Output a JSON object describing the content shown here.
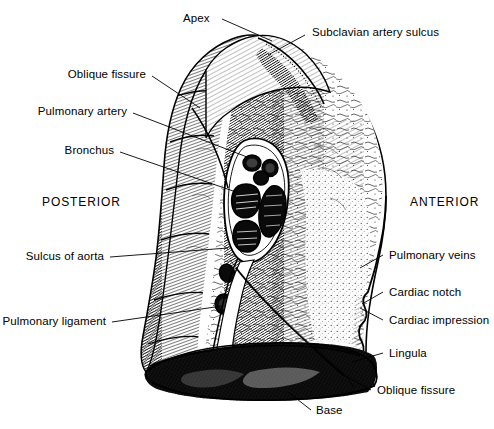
{
  "figure": {
    "orientation_left": "POSTERIOR",
    "orientation_right": "ANTERIOR",
    "ink_color": "#000000",
    "background_color": "#ffffff"
  },
  "labels": [
    {
      "id": "apex",
      "text": "Apex",
      "side": "top-left"
    },
    {
      "id": "subclavian",
      "text": "Subclavian artery sulcus",
      "side": "top-right"
    },
    {
      "id": "oblique-fissure-top",
      "text": "Oblique fissure",
      "side": "left"
    },
    {
      "id": "pulmonary-artery",
      "text": "Pulmonary artery",
      "side": "left"
    },
    {
      "id": "bronchus",
      "text": "Bronchus",
      "side": "left"
    },
    {
      "id": "sulcus-of-aorta",
      "text": "Sulcus of aorta",
      "side": "left"
    },
    {
      "id": "pulmonary-ligament",
      "text": "Pulmonary ligament",
      "side": "left"
    },
    {
      "id": "pulmonary-veins",
      "text": "Pulmonary veins",
      "side": "right"
    },
    {
      "id": "cardiac-notch",
      "text": "Cardiac notch",
      "side": "right"
    },
    {
      "id": "cardiac-impression",
      "text": "Cardiac impression",
      "side": "right"
    },
    {
      "id": "lingula",
      "text": "Lingula",
      "side": "right"
    },
    {
      "id": "oblique-fissure-bot",
      "text": "Oblique fissure",
      "side": "right"
    },
    {
      "id": "base",
      "text": "Base",
      "side": "bottom"
    }
  ]
}
